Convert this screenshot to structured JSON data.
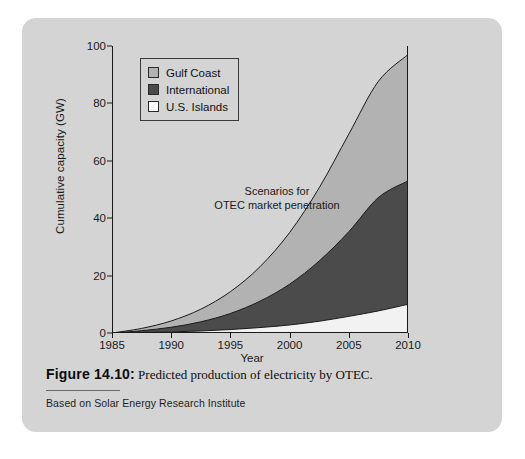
{
  "figure": {
    "caption_number": "Figure 14.10:",
    "caption_text": "Predicted production of electricity by OTEC.",
    "source": "Based on Solar Energy Research Institute"
  },
  "colors": {
    "panel": "#d4d4d4",
    "gulf_coast": "#b2b2b2",
    "international": "#4b4b4b",
    "us_islands": "#f2f2f2",
    "outline": "#1a1a1a"
  },
  "chart_data": {
    "type": "area",
    "title": "",
    "annotation": [
      "Scenarios for",
      "OTEC market penetration"
    ],
    "xlabel": "Year",
    "ylabel": "Cumulative capacity (GW)",
    "xlim": [
      1985,
      2010
    ],
    "ylim": [
      0,
      100
    ],
    "grid": false,
    "stacked": true,
    "legend_position": "top-left",
    "xticks": [
      1985,
      1990,
      1995,
      2000,
      2005,
      2010
    ],
    "yticks": [
      0,
      20,
      40,
      60,
      80,
      100
    ],
    "x": [
      1985,
      1987.5,
      1990,
      1992.5,
      1995,
      1997.5,
      2000,
      2002.5,
      2005,
      2007.5,
      2010
    ],
    "series": [
      {
        "name": "U.S. Islands",
        "color": "#f2f2f2",
        "values": [
          0,
          0.2,
          0.4,
          0.7,
          1.2,
          1.9,
          2.8,
          4.1,
          5.8,
          7.7,
          10
        ]
      },
      {
        "name": "International",
        "color": "#4b4b4b",
        "values": [
          0,
          0.6,
          1.6,
          3.2,
          5.6,
          9.2,
          14.2,
          21.0,
          29.5,
          39.5,
          43
        ]
      },
      {
        "name": "Gulf Coast",
        "color": "#b2b2b2",
        "values": [
          0,
          0.8,
          2.2,
          4.4,
          7.6,
          12.0,
          18.0,
          25.5,
          34.0,
          40.5,
          44
        ]
      }
    ],
    "cumulative_totals": [
      0,
      1.6,
      4.2,
      8.3,
      14.4,
      23.1,
      35.0,
      50.6,
      69.3,
      87.7,
      97
    ],
    "cumulative_boundaries": {
      "us_islands_top": [
        0,
        0.2,
        0.4,
        0.7,
        1.2,
        1.9,
        2.8,
        4.1,
        5.8,
        7.7,
        10
      ],
      "international_top": [
        0,
        0.8,
        2.0,
        3.9,
        6.8,
        11.1,
        17.0,
        25.1,
        35.3,
        47.2,
        53
      ],
      "gulf_coast_top": [
        0,
        1.6,
        4.2,
        8.3,
        14.4,
        23.1,
        35.0,
        50.6,
        69.3,
        87.7,
        97
      ]
    },
    "legend": [
      {
        "label": "Gulf Coast",
        "swatch": "#b2b2b2"
      },
      {
        "label": "International",
        "swatch": "#4b4b4b"
      },
      {
        "label": "U.S. Islands",
        "swatch": "#ffffff"
      }
    ]
  }
}
